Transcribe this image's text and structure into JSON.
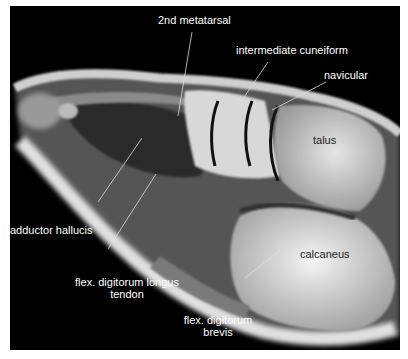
{
  "figure": {
    "type": "sagittal MRI of foot",
    "labels": {
      "metatarsal": "2nd metatarsal",
      "cuneiform": "intermediate cuneiform",
      "navicular": "navicular",
      "talus": "talus",
      "adductor": "adductor hallucis",
      "fdl_line1": "flex. digitorum longus",
      "fdl_line2": "tendon",
      "calcaneus": "calcaneus",
      "fdb_line1": "flex. digitorum",
      "fdb_line2": "brevis"
    },
    "colors": {
      "background": "#000000",
      "border": "#ffffff",
      "label_light": "#ffffff",
      "label_dark": "#222222"
    }
  }
}
